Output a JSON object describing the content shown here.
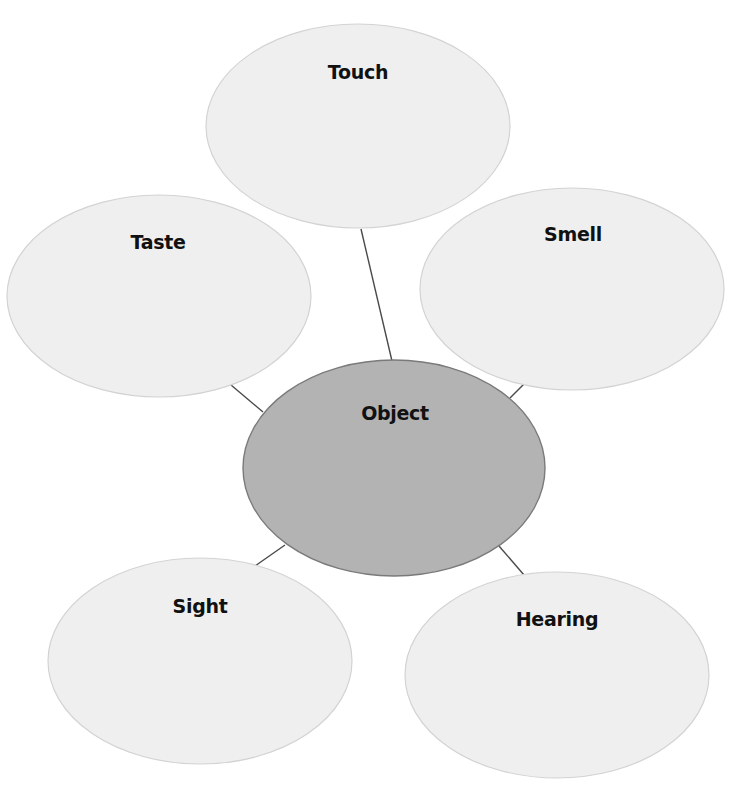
{
  "diagram": {
    "type": "concept-web",
    "center": {
      "label": "Object",
      "cx": 394,
      "cy": 468,
      "rx": 151,
      "ry": 108,
      "label_x": 395,
      "label_y": 420,
      "fill": "#b3b3b3",
      "stroke": "#7a7a7a"
    },
    "nodes": [
      {
        "id": "touch",
        "label": "Touch",
        "cx": 358,
        "cy": 126,
        "rx": 152,
        "ry": 102,
        "label_x": 358,
        "label_y": 79
      },
      {
        "id": "taste",
        "label": "Taste",
        "cx": 159,
        "cy": 296,
        "rx": 152,
        "ry": 101,
        "label_x": 158,
        "label_y": 249
      },
      {
        "id": "smell",
        "label": "Smell",
        "cx": 572,
        "cy": 289,
        "rx": 152,
        "ry": 101,
        "label_x": 573,
        "label_y": 241
      },
      {
        "id": "sight",
        "label": "Sight",
        "cx": 200,
        "cy": 661,
        "rx": 152,
        "ry": 103,
        "label_x": 200,
        "label_y": 613
      },
      {
        "id": "hearing",
        "label": "Hearing",
        "cx": 557,
        "cy": 675,
        "rx": 152,
        "ry": 103,
        "label_x": 557,
        "label_y": 626
      }
    ],
    "connectors": [
      {
        "from": "touch",
        "to": "object",
        "x1": 361,
        "y1": 229,
        "x2": 392,
        "y2": 361
      },
      {
        "from": "taste",
        "to": "object",
        "x1": 231,
        "y1": 385,
        "x2": 263,
        "y2": 412
      },
      {
        "from": "smell",
        "to": "object",
        "x1": 524,
        "y1": 384,
        "x2": 510,
        "y2": 398
      },
      {
        "from": "sight",
        "to": "object",
        "x1": 255,
        "y1": 566,
        "x2": 285,
        "y2": 545
      },
      {
        "from": "hearing",
        "to": "object",
        "x1": 499,
        "y1": 546,
        "x2": 524,
        "y2": 575
      }
    ],
    "colors": {
      "node_fill": "#efefef",
      "node_stroke": "#d3d3d3",
      "connector": "#4a4a4a",
      "text": "#111111",
      "background": "#ffffff"
    }
  }
}
